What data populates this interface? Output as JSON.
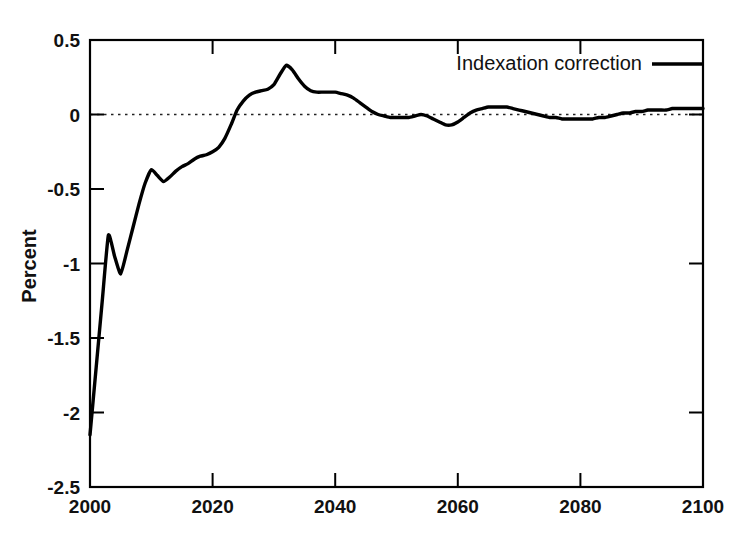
{
  "chart_data": {
    "type": "line",
    "title": "",
    "xlabel": "",
    "ylabel": "Percent",
    "xlim": [
      2000,
      2100
    ],
    "ylim": [
      -2.5,
      0.5
    ],
    "grid": false,
    "zero_reference_line": true,
    "legend_position": "top-right",
    "xticks": [
      2000,
      2020,
      2040,
      2060,
      2080,
      2100
    ],
    "xtick_labels": [
      "2000",
      "2020",
      "2040",
      "2060",
      "2080",
      "2100"
    ],
    "yticks": [
      0.5,
      0,
      -0.5,
      -1,
      -1.5,
      -2,
      -2.5
    ],
    "ytick_labels": [
      "0.5",
      "0",
      "-0.5",
      "-1",
      "-1.5",
      "-2",
      "-2.5"
    ],
    "series": [
      {
        "name": "Indexation correction",
        "color": "#000000",
        "x": [
          2000,
          2001,
          2002,
          2003,
          2004,
          2005,
          2006,
          2007,
          2008,
          2009,
          2010,
          2011,
          2012,
          2013,
          2014,
          2015,
          2016,
          2017,
          2018,
          2019,
          2020,
          2021,
          2022,
          2023,
          2024,
          2025,
          2026,
          2027,
          2028,
          2029,
          2030,
          2031,
          2032,
          2033,
          2034,
          2035,
          2036,
          2037,
          2038,
          2039,
          2040,
          2041,
          2042,
          2043,
          2044,
          2045,
          2046,
          2047,
          2048,
          2049,
          2050,
          2051,
          2052,
          2053,
          2054,
          2055,
          2056,
          2057,
          2058,
          2059,
          2060,
          2061,
          2062,
          2063,
          2064,
          2065,
          2066,
          2067,
          2068,
          2069,
          2070,
          2071,
          2072,
          2073,
          2074,
          2075,
          2076,
          2077,
          2078,
          2079,
          2080,
          2081,
          2082,
          2083,
          2084,
          2085,
          2086,
          2087,
          2088,
          2089,
          2090,
          2091,
          2092,
          2093,
          2094,
          2095,
          2096,
          2097,
          2098,
          2099,
          2100
        ],
        "y": [
          -2.15,
          -1.7,
          -1.25,
          -0.81,
          -0.95,
          -1.07,
          -0.92,
          -0.76,
          -0.6,
          -0.46,
          -0.37,
          -0.41,
          -0.45,
          -0.42,
          -0.38,
          -0.35,
          -0.33,
          -0.3,
          -0.28,
          -0.27,
          -0.25,
          -0.22,
          -0.16,
          -0.07,
          0.03,
          0.09,
          0.13,
          0.15,
          0.16,
          0.17,
          0.2,
          0.27,
          0.33,
          0.3,
          0.24,
          0.19,
          0.16,
          0.15,
          0.15,
          0.15,
          0.15,
          0.14,
          0.13,
          0.11,
          0.08,
          0.05,
          0.02,
          0.0,
          -0.01,
          -0.02,
          -0.02,
          -0.02,
          -0.02,
          -0.01,
          0.0,
          -0.01,
          -0.03,
          -0.05,
          -0.07,
          -0.07,
          -0.05,
          -0.02,
          0.01,
          0.03,
          0.04,
          0.05,
          0.05,
          0.05,
          0.05,
          0.04,
          0.03,
          0.02,
          0.01,
          0.0,
          -0.01,
          -0.02,
          -0.02,
          -0.03,
          -0.03,
          -0.03,
          -0.03,
          -0.03,
          -0.03,
          -0.02,
          -0.02,
          -0.01,
          0.0,
          0.01,
          0.01,
          0.02,
          0.02,
          0.03,
          0.03,
          0.03,
          0.03,
          0.04,
          0.04,
          0.04,
          0.04,
          0.04,
          0.04
        ],
        "annotations": [
          {
            "label": "start value at 2000",
            "x": 2000,
            "y": -2.15
          },
          {
            "label": "local peak",
            "x": 2003,
            "y": -0.81
          },
          {
            "label": "local trough",
            "x": 2005,
            "y": -1.07
          },
          {
            "label": "plateau",
            "x": 2010,
            "y": -0.37
          },
          {
            "label": "zero crossing up",
            "x": 2023.7,
            "y": 0.0
          },
          {
            "label": "maximum",
            "x": 2032,
            "y": 0.33
          },
          {
            "label": "shelf",
            "x": 2039,
            "y": 0.15
          },
          {
            "label": "zero crossing down",
            "x": 2047,
            "y": 0.0
          },
          {
            "label": "minimum after crossing",
            "x": 2058,
            "y": -0.07
          },
          {
            "label": "secondary bump",
            "x": 2067,
            "y": 0.05
          },
          {
            "label": "shallow dip",
            "x": 2079,
            "y": -0.03
          },
          {
            "label": "end value at 2100",
            "x": 2100,
            "y": 0.04
          }
        ]
      }
    ]
  },
  "legend": {
    "entries": [
      {
        "label": "Indexation correction",
        "style": "solid-line"
      }
    ]
  },
  "axes": {
    "y_axis_title": "Percent"
  }
}
